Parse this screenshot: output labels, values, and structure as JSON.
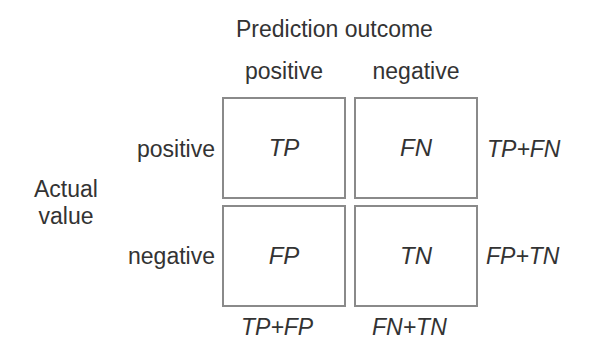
{
  "header": {
    "title": "Prediction outcome",
    "columns": [
      "positive",
      "negative"
    ]
  },
  "rows_axis": {
    "title_line1": "Actual",
    "title_line2": "value",
    "rows": [
      "positive",
      "negative"
    ]
  },
  "matrix": {
    "cells": [
      [
        "TP",
        "FN"
      ],
      [
        "FP",
        "TN"
      ]
    ]
  },
  "row_totals": [
    "TP+FN",
    "FP+TN"
  ],
  "column_totals": [
    "TP+FP",
    "FN+TN"
  ],
  "colors": {
    "text": "#333333",
    "border": "#8a8a8a",
    "background": "#ffffff"
  }
}
